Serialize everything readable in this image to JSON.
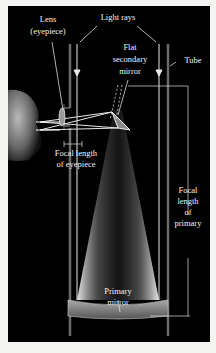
{
  "diagram": {
    "labels": {
      "lens_line1": "Lens",
      "lens_line2": "(eyepiece)",
      "light_rays": "Light rays",
      "secondary_line1": "Flat",
      "secondary_line2": "secondary",
      "secondary_line3": "mirror",
      "tube": "Tube",
      "focal_eyepiece_line1": "Focal length",
      "focal_eyepiece_line2": "of eyepiece",
      "focal_primary_line1": "Focal",
      "focal_primary_line2": "length",
      "focal_primary_line3": "of",
      "focal_primary_line4": "primary",
      "primary_line1": "Primary",
      "primary_line2": "mirror"
    },
    "colors": {
      "background": "#000000",
      "page": "#f4f4f2",
      "lines": "#e8e8e8",
      "tube": "#6a6a6a",
      "text": "#f2f2f2"
    }
  }
}
